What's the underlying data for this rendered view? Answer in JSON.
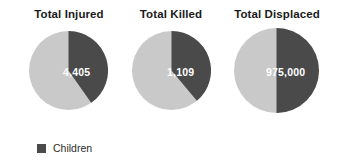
{
  "figure": {
    "background_color": "#ffffff",
    "dark_color": "#4a4a4a",
    "light_color": "#c9c9c9"
  },
  "legend": {
    "label": "Children",
    "swatch_color": "#4a4a4a",
    "position": "bottom-left"
  },
  "chart_data": {
    "type": "pie",
    "title": "",
    "subtitle": "",
    "xlabel": "",
    "ylabel": "",
    "grid": false,
    "legend_position": "bottom-left",
    "legend_entries": [
      "Children"
    ],
    "series_colors": {
      "Children": "#4a4a4a",
      "Other": "#c9c9c9"
    },
    "panels": [
      {
        "title": "Total Injured",
        "value_label": "4,405",
        "value": 4405,
        "slices": [
          {
            "name": "Children",
            "fraction": 0.403,
            "degrees": 145,
            "color": "#4a4a4a"
          },
          {
            "name": "Other",
            "fraction": 0.597,
            "degrees": 215,
            "color": "#c9c9c9"
          }
        ]
      },
      {
        "title": "Total Killed",
        "value_label": "1,109",
        "value": 1109,
        "slices": [
          {
            "name": "Children",
            "fraction": 0.389,
            "degrees": 140,
            "color": "#4a4a4a"
          },
          {
            "name": "Other",
            "fraction": 0.611,
            "degrees": 220,
            "color": "#c9c9c9"
          }
        ]
      },
      {
        "title": "Total Displaced",
        "value_label": "975,000",
        "value": 975000,
        "slices": [
          {
            "name": "Children",
            "fraction": 0.5,
            "degrees": 180,
            "color": "#4a4a4a"
          },
          {
            "name": "Other",
            "fraction": 0.5,
            "degrees": 180,
            "color": "#c9c9c9"
          }
        ]
      }
    ]
  }
}
